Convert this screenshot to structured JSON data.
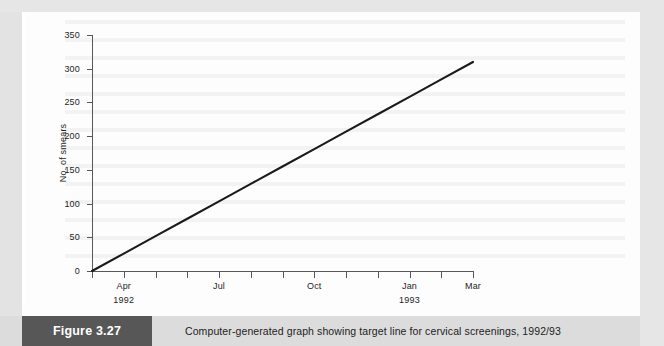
{
  "figure": {
    "badge_label": "Figure 3.27",
    "caption": "Computer-generated graph showing target line for cervical screenings, 1992/93"
  },
  "colors": {
    "badge_background": "#575757",
    "caption_background": "#dcdcdc",
    "page_background": "#e6e6e6",
    "panel_background": "#fdfdfd",
    "axis": "#55585c",
    "series_line": "#1a1a1a"
  },
  "chart_data": {
    "type": "line",
    "title": "",
    "subtitle": "",
    "xlabel": "",
    "ylabel": "No. of smears",
    "ylim": [
      0,
      350
    ],
    "yticks": [
      0,
      50,
      100,
      150,
      200,
      250,
      300,
      350
    ],
    "ytick_labels": [
      "0",
      "50",
      "100",
      "150",
      "200",
      "250",
      "300",
      "350"
    ],
    "grid": false,
    "legend": "none",
    "x": [
      0,
      1,
      2,
      3,
      4,
      5,
      6,
      7,
      8,
      9,
      10,
      11,
      12
    ],
    "xtick_labels": [
      "",
      "Apr",
      "",
      "",
      "Jul",
      "",
      "",
      "Oct",
      "",
      "",
      "Jan",
      "",
      "Mar"
    ],
    "xtick_sublabels": [
      "",
      "1992",
      "",
      "",
      "",
      "",
      "",
      "",
      "",
      "",
      "1993",
      "",
      ""
    ],
    "series": [
      {
        "name": "Target line",
        "values": [
          0,
          25.8,
          51.7,
          77.5,
          103.3,
          129.2,
          155.0,
          180.8,
          206.7,
          232.5,
          258.3,
          284.2,
          310
        ]
      }
    ],
    "annotations": []
  }
}
